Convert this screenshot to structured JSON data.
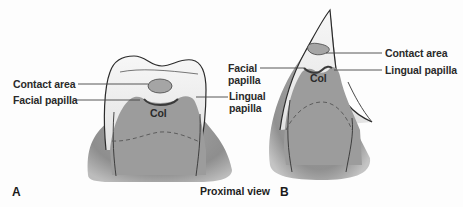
{
  "figure": {
    "caption": "Proximal view",
    "panels": [
      {
        "id": "A",
        "label": "A",
        "labels": {
          "contact_area": "Contact area",
          "facial_papilla": "Facial papilla",
          "lingual_papilla_line1": "Lingual",
          "lingual_papilla_line2": "papilla",
          "col": "Col"
        }
      },
      {
        "id": "B",
        "label": "B",
        "labels": {
          "facial_papilla_line1": "Facial",
          "facial_papilla_line2": "papilla",
          "contact_area": "Contact area",
          "lingual_papilla": "Lingual papilla",
          "col": "Col"
        }
      }
    ],
    "colors": {
      "tooth": "#f0f0f0",
      "gingiva": "#9a9a9a",
      "contact_area": "#a8a8a8",
      "outline": "#2b2b2b",
      "text": "#222222"
    }
  }
}
